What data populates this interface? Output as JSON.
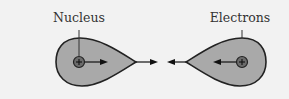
{
  "labels": {
    "nucleus": "Nucleus",
    "electrons": "Electrons"
  },
  "colors": {
    "background": "#f2f2f2",
    "cloud_fill": "#a9a9a9",
    "outline": "#222222",
    "nucleus_fill": "#6b6b6b"
  },
  "nucleus_symbol": "+"
}
